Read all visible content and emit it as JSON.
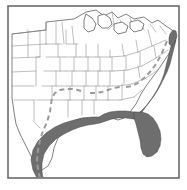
{
  "figure": {
    "width": 187,
    "height": 190
  },
  "frame": {
    "name": "map-border",
    "x": 8,
    "y": 6,
    "width": 171,
    "height": 172,
    "stroke": "#6b6b6b",
    "stroke_width": 1.6,
    "fill": "#ffffff"
  },
  "style": {
    "background_color": "#ffffff",
    "land_fill": "#ffffff",
    "state_line_color": "#8a8a8a",
    "state_line_width": 0.55,
    "coast_line_color": "#4a4a4a",
    "coast_line_width": 0.7,
    "range_fill_color": "#6e6e6e",
    "range_stroke_color": "#4a4a4a",
    "dashed_line_color": "#9b9b9b",
    "dashed_line_width": 2.0,
    "dash_pattern": "5 3.5"
  },
  "legend_items": [
    {
      "key": "shaded-range",
      "label": "Shaded coastal range",
      "color": "#6e6e6e"
    },
    {
      "key": "dashed-boundary",
      "label": "Dashed interior boundary",
      "color": "#9b9b9b"
    }
  ],
  "geography": {
    "national_outline": "M 12 58 L 12 34 L 46 30 L 46 22 L 74 19 L 86 12 L 96 10 L 104 16 L 112 12 L 118 18 L 126 14 L 134 19 L 144 17 L 152 23 L 158 20 L 166 26 L 172 30 L 176 38 L 174 46 L 170 52 L 166 58 L 162 64 L 158 70 L 152 78 L 146 86 L 141 94 L 136 104 L 130 112 L 124 118 L 118 120 L 112 118 L 106 116 L 100 118 L 94 120 L 88 118 L 82 118 L 76 120 L 70 124 L 64 130 L 58 138 L 54 148 L 52 158 L 48 166 L 42 170 L 36 166 L 32 158 L 28 150 L 24 142 L 20 134 L 16 124 L 14 112 L 12 98 L 12 82 Z",
    "coast_outline_note": "Gulf coast runs from south Texas east through Louisiana and Mississippi, around the Florida peninsula, then north along the Atlantic seaboard past the Carolinas and Chesapeake Bay."
  },
  "range_polygons": [
    {
      "name": "gulf-coastal-band",
      "region": "Texas to Florida Panhandle Gulf coast",
      "path": "M 37 178 L 33 170 L 31 160 L 33 150 L 38 141 L 46 133 L 55 127 L 64 123 L 74 120 L 84 118 L 92 117 L 99 117 L 104 114 L 110 112 L 118 111 L 126 111 L 134 112 L 140 113 L 140 119 L 133 119 L 126 118 L 118 118 L 112 119 L 106 121 L 100 123 L 95 124 L 88 125 L 80 127 L 72 130 L 64 134 L 56 139 L 49 146 L 44 154 L 42 163 L 42 172 L 43 178 Z"
    },
    {
      "name": "florida-peninsula",
      "region": "Florida",
      "path": "M 134 112 L 142 112 L 148 114 L 153 118 L 157 124 L 160 131 L 161 139 L 160 146 L 157 152 L 152 156 L 147 157 L 143 154 L 141 148 L 140 140 L 138 132 L 136 124 L 134 118 Z"
    },
    {
      "name": "south-atlantic-coastal-band",
      "region": "Georgia and Carolinas Atlantic coast",
      "path": "M 140 112 L 146 106 L 152 98 L 157 90 L 161 82 L 164 74 L 166 66 L 168 58 L 170 50 L 172 42 L 174 38 L 176 40 L 174 48 L 172 56 L 170 64 L 167 72 L 163 80 L 159 88 L 154 96 L 148 104 L 142 112 Z"
    },
    {
      "name": "chesapeake-bay-band",
      "region": "Chesapeake Bay and Delmarva",
      "path": "M 170 34 L 173 30 L 176 31 L 177 36 L 175 42 L 172 46 L 169 44 L 169 38 Z"
    }
  ],
  "dashed_boundary": {
    "name": "interior-range-boundary",
    "segments": [
      {
        "path": "M 40 178 L 38 170 L 37 160 L 38 150 L 40 140 L 43 131 L 47 122 L 50 112 L 51 104 L 52 98 L 55 93 L 60 90 L 66 89 L 72 89 L 78 90 L 84 92"
      },
      {
        "path": "M 90 93 L 96 93 L 102 92 L 108 90 L 114 88 L 120 87"
      },
      {
        "path": "M 126 87 L 132 86 L 138 83 L 144 78 L 150 72 L 156 64 L 161 55 L 165 46 L 168 38"
      }
    ]
  },
  "state_boundaries": {
    "count_note": "Interior state lines drawn as thin gray polylines across the lower 48 states",
    "paths": [
      "M 12 34 L 46 30",
      "M 12 46 L 46 44",
      "M 12 58 L 40 57",
      "M 12 72 L 36 71",
      "M 12 86 L 34 86",
      "M 14 100 L 34 100",
      "M 28 30 L 28 57",
      "M 40 30 L 40 57 L 36 57 L 36 86",
      "M 46 22 L 46 44",
      "M 46 44 L 62 44",
      "M 46 57 L 64 57",
      "M 44 71 L 66 71",
      "M 42 86 L 68 86",
      "M 36 100 L 70 100",
      "M 34 100 L 34 122 L 40 128",
      "M 56 22 L 56 44",
      "M 58 44 L 58 57",
      "M 60 57 L 60 71",
      "M 56 71 L 56 86",
      "M 52 86 L 52 100",
      "M 62 22 L 64 44",
      "M 66 30 L 66 44 L 78 44",
      "M 64 57 L 80 57",
      "M 66 71 L 84 71",
      "M 68 86 L 88 86",
      "M 70 100 L 92 100",
      "M 72 26 L 74 44",
      "M 76 44 L 76 57",
      "M 74 57 L 74 71",
      "M 72 71 L 72 86",
      "M 70 86 L 70 100",
      "M 68 100 L 68 117",
      "M 80 57 L 96 57",
      "M 84 71 L 100 71",
      "M 88 86 L 104 86",
      "M 92 100 L 108 100",
      "M 86 44 L 86 57",
      "M 88 57 L 88 71",
      "M 86 71 L 86 86",
      "M 84 86 L 84 100",
      "M 82 100 L 82 115",
      "M 96 57 L 110 57",
      "M 100 71 L 114 71",
      "M 104 86 L 118 86",
      "M 108 100 L 120 100",
      "M 98 44 L 98 57",
      "M 100 57 L 100 71",
      "M 98 71 L 98 86",
      "M 96 86 L 96 100",
      "M 94 100 L 94 114",
      "M 110 50 L 110 57",
      "M 112 57 L 112 71",
      "M 110 71 L 110 86",
      "M 108 86 L 108 100",
      "M 110 57 L 124 56",
      "M 114 71 L 128 70",
      "M 118 86 L 132 84",
      "M 120 100 L 134 97",
      "M 122 44 L 124 56",
      "M 126 56 L 126 70",
      "M 124 70 L 124 84",
      "M 122 84 L 122 100",
      "M 124 56 L 138 52",
      "M 128 70 L 142 66",
      "M 132 84 L 146 78",
      "M 134 97 L 142 90",
      "M 136 40 L 138 52",
      "M 140 52 L 140 66",
      "M 138 66 L 140 78",
      "M 138 52 L 152 46",
      "M 142 66 L 156 58",
      "M 146 78 L 158 70",
      "M 148 30 L 152 46",
      "M 154 46 L 156 58",
      "M 152 46 L 166 40",
      "M 156 58 L 168 50",
      "M 112 12 L 114 24 L 108 30",
      "M 120 20 L 124 30",
      "M 130 18 L 134 28",
      "M 140 20 L 144 30",
      "M 150 24 L 156 32",
      "M 160 26 L 166 34"
    ]
  },
  "great_lakes": {
    "name": "great-lakes-outlines",
    "paths": [
      "M 86 14 L 92 18 L 96 24 L 94 30 L 88 32 L 84 28 L 84 20 Z",
      "M 98 16 L 104 14 L 110 18 L 112 24 L 108 28 L 102 28 L 98 24 Z",
      "M 114 24 L 122 22 L 128 26 L 126 32 L 118 34 L 114 30 Z",
      "M 130 22 L 138 20 L 144 24 L 142 30 L 134 32 L 130 28 Z"
    ]
  }
}
